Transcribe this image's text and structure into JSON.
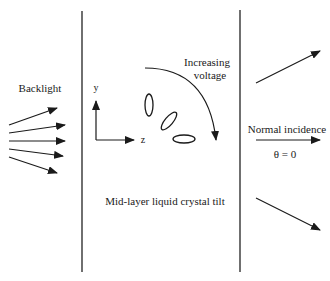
{
  "diagram": {
    "labels": {
      "backlight": "Backlight",
      "increasing_voltage_line1": "Increasing",
      "increasing_voltage_line2": "voltage",
      "axis_y": "y",
      "axis_z": "z",
      "normal_incidence": "Normal incidence",
      "theta": "θ = 0",
      "mid_layer": "Mid-layer liquid crystal tilt"
    },
    "backlight_ray_count": 5,
    "output_rays": [
      "upward-oblique",
      "normal",
      "downward-oblique"
    ],
    "molecule_orientations": [
      "vertical",
      "tilted",
      "horizontal"
    ],
    "colors": {
      "ink": "#1a1a1a",
      "panel_line": "#333333",
      "background": "#ffffff"
    }
  }
}
